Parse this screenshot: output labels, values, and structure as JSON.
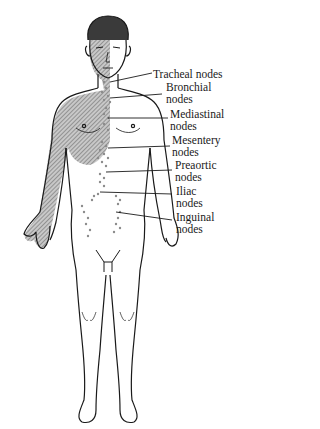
{
  "diagram": {
    "colors": {
      "ink": "#1a1a1a",
      "shade": "#8c8c8c",
      "nodes": "#9a9a9a",
      "background": "#ffffff"
    },
    "labels": [
      {
        "id": "tracheal",
        "line1": "Tracheal nodes",
        "line2": ""
      },
      {
        "id": "bronchial",
        "line1": "Bronchial",
        "line2": "nodes"
      },
      {
        "id": "mediastinal",
        "line1": "Mediastinal",
        "line2": "nodes"
      },
      {
        "id": "mesentery",
        "line1": "Mesentery",
        "line2": "nodes"
      },
      {
        "id": "preaortic",
        "line1": "Preaortic",
        "line2": "nodes"
      },
      {
        "id": "iliac",
        "line1": "Iliac",
        "line2": "nodes"
      },
      {
        "id": "inguinal",
        "line1": "Inguinal",
        "line2": "nodes"
      }
    ]
  }
}
